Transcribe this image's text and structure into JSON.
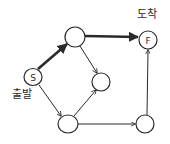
{
  "diagram": {
    "type": "directed-graph",
    "labels": {
      "start": "출발",
      "finish": "도착"
    },
    "nodes": [
      {
        "id": "S",
        "letter": "S",
        "x": 33,
        "y": 77,
        "r": 9
      },
      {
        "id": "A",
        "letter": "",
        "x": 75,
        "y": 37,
        "r": 10
      },
      {
        "id": "F",
        "letter": "F",
        "x": 148,
        "y": 40,
        "r": 9
      },
      {
        "id": "B",
        "letter": "",
        "x": 101,
        "y": 82,
        "r": 9
      },
      {
        "id": "C",
        "letter": "",
        "x": 68,
        "y": 124,
        "r": 10
      },
      {
        "id": "D",
        "letter": "",
        "x": 145,
        "y": 124,
        "r": 9
      }
    ],
    "edges": [
      {
        "from": "S",
        "to": "A",
        "bold": true
      },
      {
        "from": "A",
        "to": "F",
        "bold": true
      },
      {
        "from": "A",
        "to": "B",
        "bold": false
      },
      {
        "from": "S",
        "to": "C",
        "bold": false
      },
      {
        "from": "C",
        "to": "B",
        "bold": false
      },
      {
        "from": "C",
        "to": "D",
        "bold": false
      },
      {
        "from": "D",
        "to": "F",
        "bold": false
      }
    ],
    "colors": {
      "stroke": "#2a2a2a",
      "background": "#ffffff"
    }
  }
}
